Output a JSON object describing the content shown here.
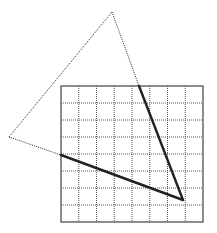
{
  "diagram": {
    "type": "geometry-grid-triangle",
    "canvas": {
      "width": 217,
      "height": 233,
      "background": "#ffffff"
    },
    "grid": {
      "x": 61,
      "y": 86,
      "width": 142,
      "height": 136,
      "cols": 8,
      "rows": 8,
      "border_color": "#444444",
      "line_color": "#555555",
      "line_style": "dotted"
    },
    "triangle": {
      "vertices": [
        {
          "name": "top",
          "x": 112,
          "y": 12
        },
        {
          "name": "left",
          "x": 9,
          "y": 137
        },
        {
          "name": "bottom-right",
          "x": 183,
          "y": 200
        }
      ],
      "outside_style": "dotted",
      "inside_style": "solid-thick",
      "color": "#222222"
    },
    "intersections": [
      {
        "edge": "top-to-bottom-right",
        "x": 139,
        "y": 86
      },
      {
        "edge": "left-to-bottom-right",
        "x": 61,
        "y": 155
      }
    ]
  }
}
